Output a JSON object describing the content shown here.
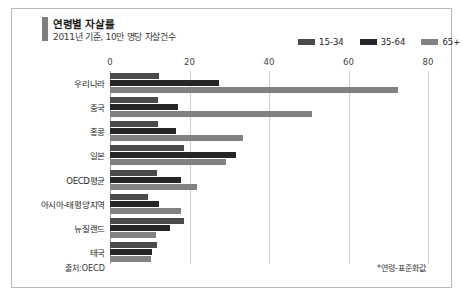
{
  "header": {
    "title": "연령별 자살률",
    "subtitle": "2011년 기준, 10만 명당 자살건수",
    "accent_color": "#7d7d7d"
  },
  "footer": {
    "source": "출처:OECD",
    "note": "*연령-표준화값"
  },
  "chart_data": {
    "type": "bar",
    "orientation": "horizontal",
    "title": "연령별 자살률",
    "subtitle": "2011년 기준, 10만 명당 자살건수",
    "xlabel": "",
    "ylabel": "",
    "xlim": [
      0,
      80
    ],
    "xticks": [
      0,
      20,
      40,
      60,
      80
    ],
    "xtick_labels": [
      "0",
      "20",
      "40",
      "60",
      "80"
    ],
    "grid": true,
    "legend_position": "top-right",
    "categories": [
      "우리나라",
      "중국",
      "홍콩",
      "일본",
      "OECD평균",
      "아시아-태평양지역",
      "뉴질랜드",
      "태국"
    ],
    "series": [
      {
        "name": "15-34",
        "color": "#4a4a4a",
        "values": [
          12.3,
          12.0,
          12.2,
          18.7,
          11.7,
          9.5,
          18.7,
          11.7
        ]
      },
      {
        "name": "35-64",
        "color": "#262626",
        "values": [
          27.3,
          17.1,
          16.7,
          31.8,
          17.9,
          12.4,
          15.0,
          10.5
        ]
      },
      {
        "name": "65+",
        "color": "#828282",
        "values": [
          72.4,
          50.8,
          33.4,
          29.3,
          21.8,
          17.9,
          11.6,
          10.3
        ]
      }
    ]
  }
}
